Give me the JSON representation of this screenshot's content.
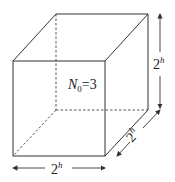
{
  "diagram": {
    "type": "cube",
    "center_label": {
      "symbol": "N",
      "subscript": "0",
      "rest": "=3"
    },
    "dimensions": {
      "height": {
        "base": "2",
        "exp": "h"
      },
      "depth": {
        "base": "2",
        "exp": "h"
      },
      "width": {
        "base": "2",
        "exp": "h"
      }
    },
    "colors": {
      "line": "#333333",
      "background": "#ffffff"
    }
  }
}
